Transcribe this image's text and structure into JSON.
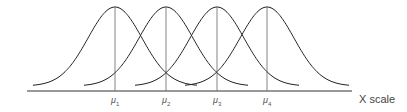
{
  "diagram": {
    "title": "",
    "axis_label": "X scale",
    "distributions": [
      {
        "label": "μ",
        "sub": "1",
        "mean_x": 115
      },
      {
        "label": "μ",
        "sub": "2",
        "mean_x": 166
      },
      {
        "label": "μ",
        "sub": "3",
        "mean_x": 217
      },
      {
        "label": "μ",
        "sub": "4",
        "mean_x": 267
      }
    ]
  },
  "chart_data": {
    "type": "line",
    "title": "",
    "xlabel": "X scale",
    "ylabel": "",
    "series": [
      {
        "name": "μ1",
        "mean": 1
      },
      {
        "name": "μ2",
        "mean": 2
      },
      {
        "name": "μ3",
        "mean": 3
      },
      {
        "name": "μ4",
        "mean": 4
      }
    ],
    "tick_labels": [
      "μ1",
      "μ2",
      "μ3",
      "μ4"
    ],
    "grid": false
  }
}
